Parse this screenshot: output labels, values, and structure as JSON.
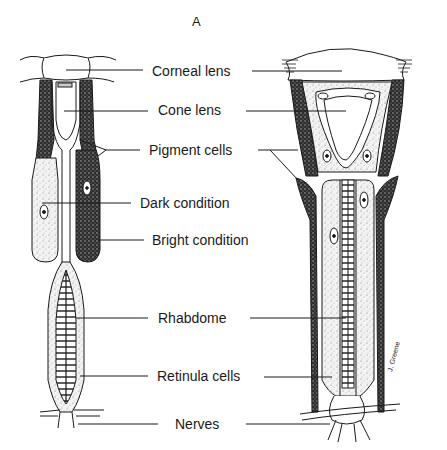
{
  "figure": {
    "panel_letter": "A",
    "labels": [
      {
        "id": "corneal-lens",
        "text": "Corneal lens"
      },
      {
        "id": "cone-lens",
        "text": "Cone lens"
      },
      {
        "id": "pigment-cells",
        "text": "Pigment cells"
      },
      {
        "id": "dark-condition",
        "text": "Dark condition"
      },
      {
        "id": "bright-condition",
        "text": "Bright condition"
      },
      {
        "id": "rhabdome",
        "text": "Rhabdome"
      },
      {
        "id": "retinula-cells",
        "text": "Retinula cells"
      },
      {
        "id": "nerves",
        "text": "Nerves"
      }
    ],
    "colors": {
      "ink": "#1a1a1a",
      "stipple_light": "#e8e8e8",
      "pigment_dark": "#3a3a3a",
      "background": "#ffffff"
    }
  }
}
